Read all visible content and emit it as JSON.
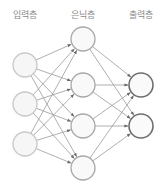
{
  "labels": {
    "input": "입력층",
    "hidden": "은닉층",
    "output": "출력층"
  },
  "layers": {
    "input": {
      "x": 25,
      "nodes": [
        65,
        104,
        144
      ],
      "stroke": "#c8c8c8",
      "fill": "#f6f6f6"
    },
    "hidden": {
      "x": 83,
      "nodes": [
        39,
        85,
        126,
        168
      ],
      "stroke": "#a8a8a8",
      "fill": "#f9f9f9"
    },
    "output": {
      "x": 141,
      "nodes": [
        85,
        126
      ],
      "stroke": "#6e6e6e",
      "fill": "#fafafa"
    }
  },
  "node_radius": 12,
  "edge_color": "#9a9a9a",
  "arrow_color": "#6a6a6a"
}
